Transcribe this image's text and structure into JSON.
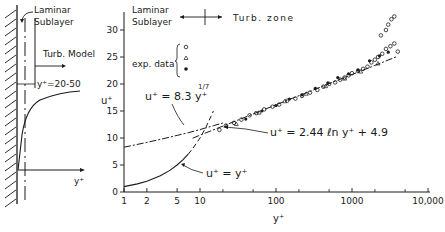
{
  "left_diagram": {
    "labels": {
      "laminar_line1": "Laminar",
      "laminar_line2": "Sublayer",
      "turb_model": "Turb. Model",
      "yplus_range": "y⁺=20-50",
      "x_axis": "y⁺"
    }
  },
  "chart_data": {
    "type": "line",
    "title": "",
    "xlabel": "y⁺",
    "ylabel": "u⁺",
    "xscale": "log",
    "xlim": [
      1,
      10000
    ],
    "ylim": [
      0,
      33
    ],
    "x_ticks": [
      1,
      2,
      5,
      10,
      100,
      1000,
      10000
    ],
    "x_tick_labels": [
      "1",
      "2",
      "5",
      "10",
      "100",
      "1000",
      "10,000"
    ],
    "x_minor_ticks": [
      20,
      50,
      200,
      500,
      2000,
      5000
    ],
    "y_ticks": [
      0,
      5,
      10,
      15,
      20,
      25,
      30
    ],
    "y_tick_labels": [
      "0",
      "5",
      "10",
      "15",
      "20",
      "25",
      "30"
    ],
    "grid": false,
    "annotations": {
      "laminar_line1": "Laminar",
      "laminar_line2": "Sublayer",
      "turb_zone": "Turb.  zone",
      "exp_data": "exp. data",
      "eq_power": "u⁺ = 8.3 y⁺",
      "eq_power_exp": "1/7",
      "eq_log": "u⁺ = 2.44 ℓn y⁺  + 4.9",
      "eq_linear": "u⁺ =  y⁺"
    },
    "legend": {
      "title": "exp. data",
      "entries": [
        "open circle",
        "open triangle",
        "filled circle"
      ],
      "position": "upper-left"
    },
    "series": [
      {
        "name": "u+ = y+",
        "style": "solid, dashed beyond y+≈7",
        "x": [
          1,
          1.5,
          2,
          3,
          4,
          5,
          6,
          7,
          8,
          10,
          12,
          15
        ],
        "y": [
          1,
          1.5,
          2,
          3,
          4,
          5,
          6,
          7,
          8,
          10,
          12,
          15
        ]
      },
      {
        "name": "u+ = 8.3 y+^(1/7)",
        "style": "dash-dot",
        "x": [
          1,
          2,
          3,
          5,
          7,
          10,
          15,
          20
        ],
        "y": [
          8.3,
          9.18,
          9.74,
          10.48,
          10.99,
          11.55,
          12.27,
          12.78
        ]
      },
      {
        "name": "u+ = 2.44 ln y+ + 4.9",
        "style": "dash-dot",
        "x": [
          8,
          10,
          20,
          50,
          100,
          200,
          500,
          1000,
          2000,
          4000
        ],
        "y": [
          9.97,
          10.52,
          12.21,
          14.45,
          16.14,
          17.83,
          20.06,
          21.75,
          23.45,
          25.14
        ]
      },
      {
        "name": "exp. data (open circle)",
        "style": "marker-circle-open",
        "x": [
          18,
          22,
          28,
          35,
          45,
          55,
          70,
          90,
          110,
          140,
          180,
          220,
          280,
          350,
          420,
          500,
          600,
          700,
          800,
          900,
          1000,
          1200,
          1400,
          1600,
          1800,
          2000,
          2200,
          2500,
          2800,
          3200,
          3600,
          2400,
          2800,
          3000,
          3300,
          3600,
          4000
        ],
        "y": [
          11.5,
          12.3,
          12.8,
          13.4,
          14.2,
          14.6,
          15.3,
          15.8,
          16.2,
          16.9,
          17.3,
          17.8,
          18.4,
          18.9,
          19.5,
          20.0,
          20.3,
          20.8,
          21.2,
          21.6,
          22.0,
          22.4,
          22.8,
          23.2,
          24.0,
          24.5,
          25.0,
          25.6,
          26.5,
          27.0,
          27.5,
          29.0,
          30.0,
          31.0,
          32.0,
          32.5,
          26.0
        ]
      },
      {
        "name": "exp. data (open triangle)",
        "style": "marker-triangle-open",
        "x": [
          30,
          60,
          130,
          250,
          450,
          800,
          1300,
          2200
        ],
        "y": [
          12.6,
          14.7,
          16.8,
          18.2,
          19.6,
          21.0,
          22.3,
          23.8
        ]
      },
      {
        "name": "exp. data (filled circle)",
        "style": "marker-circle-filled",
        "x": [
          40,
          65,
          100,
          150,
          220,
          330,
          480,
          650,
          900,
          1200,
          1700,
          2300,
          3000
        ],
        "y": [
          13.5,
          15.0,
          16.0,
          17.2,
          18.0,
          19.2,
          20.2,
          21.2,
          21.9,
          22.6,
          24.3,
          25.2,
          25.9
        ]
      }
    ]
  }
}
